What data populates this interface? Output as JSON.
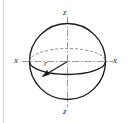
{
  "figure": {
    "type": "geometry-diagram",
    "background_color": "#ffffff",
    "stroke_color": "#1a1a1a",
    "axis_color": "#999999",
    "hidden_edge_color": "#8a8a8a",
    "labels": {
      "x_left": "x",
      "x_right": "x",
      "z_top": "z",
      "z_bottom": "z",
      "radius": "r"
    },
    "icons": {
      "sphere": "sphere-outline-icon",
      "equator": "equator-ellipse-icon",
      "x_axis": "x-axis-icon",
      "z_axis": "z-axis-icon",
      "radius_arrow": "radius-arrow-icon",
      "left_rule": "page-rule-icon"
    },
    "geometry": {
      "center": [
        67.5,
        61.5
      ],
      "sphere_radius": 38,
      "equator_rx": 38,
      "equator_ry": 13,
      "radius_arrow_from": [
        67.5,
        61.5
      ],
      "radius_arrow_to": [
        42.0,
        77.0
      ]
    }
  }
}
